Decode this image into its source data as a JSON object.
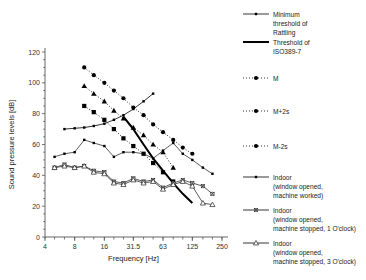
{
  "chart_data": {
    "type": "line",
    "title": "",
    "xlabel": "Frequency [Hz]",
    "ylabel": "Sound pressure levels [dB]",
    "xscale": "log",
    "xlim": [
      4,
      250
    ],
    "ylim": [
      0,
      120
    ],
    "xticks": [
      "4",
      "8",
      "16",
      "31.5",
      "63",
      "125",
      "250"
    ],
    "xtick_values": [
      4,
      8,
      16,
      31.5,
      63,
      125,
      250
    ],
    "yticks": [
      "0",
      "20",
      "40",
      "60",
      "80",
      "100",
      "120"
    ],
    "ytick_values": [
      0,
      20,
      40,
      60,
      80,
      100,
      120
    ],
    "grid": false,
    "legend_position": "right",
    "x": [
      5,
      6.3,
      8,
      10,
      12.5,
      16,
      20,
      25,
      31.5,
      40,
      50,
      63,
      80,
      100,
      125,
      160,
      200
    ],
    "series": [
      {
        "name": "Minimum threshold of Rattling",
        "marker": "small-square",
        "line": "solid",
        "color": "#000000",
        "x": [
          6.3,
          8,
          10,
          12.5,
          16,
          20,
          25,
          31.5,
          40,
          50
        ],
        "values": [
          70,
          70.5,
          71,
          72,
          73.5,
          76,
          79,
          83,
          88,
          93
        ]
      },
      {
        "name": "Threshold of ISO389-7",
        "marker": "none",
        "line": "thick-solid",
        "color": "#000000",
        "x": [
          25,
          31.5,
          40,
          50,
          63,
          80,
          100,
          125
        ],
        "values": [
          78,
          70,
          60,
          51,
          43,
          35,
          28,
          22
        ]
      },
      {
        "name": "M+2s",
        "marker": "circle",
        "line": "dotted",
        "color": "#000000",
        "x": [
          10,
          12.5,
          16,
          20,
          25,
          31.5,
          40,
          50,
          63,
          80,
          100,
          125
        ],
        "values": [
          110,
          105,
          100,
          95,
          90,
          84,
          79,
          73,
          68,
          63,
          58,
          54
        ]
      },
      {
        "name": "M",
        "marker": "triangle",
        "line": "dotted",
        "color": "#000000",
        "x": [
          10,
          12.5,
          16,
          20,
          25,
          31.5,
          40,
          50,
          63,
          80
        ],
        "values": [
          98,
          93,
          88,
          82,
          77,
          71,
          66,
          60,
          55,
          45
        ]
      },
      {
        "name": "M-2s",
        "marker": "square",
        "line": "dotted",
        "color": "#000000",
        "x": [
          10,
          12.5,
          16,
          20,
          25,
          31.5,
          40,
          50,
          63,
          80
        ],
        "values": [
          85,
          81,
          76,
          70,
          64,
          59,
          54,
          48,
          42,
          36
        ]
      },
      {
        "name": "Indoor (window opened, machine worked)",
        "marker": "small-square",
        "line": "solid",
        "color": "#333333",
        "x": [
          5,
          6.3,
          8,
          10,
          12.5,
          16,
          20,
          25,
          31.5,
          40,
          50,
          63,
          80,
          100,
          125,
          160,
          200
        ],
        "values": [
          52,
          54,
          55,
          63,
          61,
          59,
          52,
          55,
          55,
          54,
          51,
          56,
          61,
          54,
          50,
          45,
          41
        ]
      },
      {
        "name": "Indoor (window opened, machine stopped, 1 O'clock)",
        "marker": "x-square",
        "line": "solid",
        "color": "#333333",
        "x": [
          5,
          6.3,
          8,
          10,
          12.5,
          16,
          20,
          25,
          31.5,
          40,
          50,
          63,
          80,
          100,
          125,
          160,
          200
        ],
        "values": [
          45,
          47,
          45,
          46,
          43,
          42,
          36,
          35,
          38,
          36,
          37,
          32,
          35,
          37,
          35,
          33,
          28
        ]
      },
      {
        "name": "Indoor (window opened, machine stopped, 3 O'clock)",
        "marker": "open-triangle",
        "line": "solid",
        "color": "#333333",
        "x": [
          5,
          6.3,
          8,
          10,
          12.5,
          16,
          20,
          25,
          31.5,
          40,
          50,
          63,
          80,
          100,
          125,
          160,
          200
        ],
        "values": [
          45,
          46,
          45,
          46,
          42,
          41,
          35,
          34,
          37,
          35,
          36,
          31,
          34,
          36,
          33,
          22,
          21
        ]
      }
    ]
  },
  "legend": {
    "items": [
      {
        "key": "rattling",
        "marker": "small-square",
        "line": "solid",
        "lines": [
          "Minimum",
          "threshold of",
          "Rattling"
        ]
      },
      {
        "key": "iso",
        "marker": "none",
        "line": "thick-solid",
        "lines": [
          "Threshold of",
          "ISO389-7"
        ]
      },
      {
        "key": "m",
        "marker": "circle",
        "line": "dotted",
        "lines": [
          "M"
        ]
      },
      {
        "key": "mp2s",
        "marker": "circle",
        "line": "dotted",
        "lines": [
          "M+2s"
        ]
      },
      {
        "key": "mm2s",
        "marker": "circle",
        "line": "dotted",
        "lines": [
          "M-2s"
        ]
      },
      {
        "key": "indoor-worked",
        "marker": "small-square",
        "line": "solid",
        "lines": [
          "Indoor",
          "(window opened,",
          "machine worked)"
        ]
      },
      {
        "key": "indoor-stop1",
        "marker": "x-square",
        "line": "solid",
        "lines": [
          "Indoor",
          "(window opened,",
          "machine stopped, 1 O'clock)"
        ]
      },
      {
        "key": "indoor-stop3",
        "marker": "open-triangle",
        "line": "solid",
        "lines": [
          "Indoor",
          "(window opened,",
          "machine stopped, 3 O'clock)"
        ]
      }
    ]
  }
}
